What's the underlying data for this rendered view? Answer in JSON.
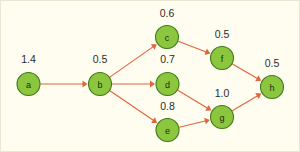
{
  "diagram": {
    "colors": {
      "background": "#fffdf0",
      "node_fill": "#8cc63f",
      "node_stroke": "#3f7a1e",
      "edge": "#e2643c",
      "text": "#2b2b2b"
    },
    "nodes": [
      {
        "id": "a",
        "label": "a",
        "weight": "1.4",
        "cx": 28.5,
        "cy": 84,
        "r": 11.5,
        "wx": 28.5,
        "wy": 63
      },
      {
        "id": "b",
        "label": "b",
        "weight": "0.5",
        "cx": 100,
        "cy": 84,
        "r": 11.5,
        "wx": 100,
        "wy": 63
      },
      {
        "id": "c",
        "label": "c",
        "weight": "0.6",
        "cx": 167,
        "cy": 37,
        "r": 11.5,
        "wx": 167,
        "wy": 17
      },
      {
        "id": "d",
        "label": "d",
        "weight": "0.7",
        "cx": 167.5,
        "cy": 84,
        "r": 11.5,
        "wx": 167.5,
        "wy": 63
      },
      {
        "id": "e",
        "label": "e",
        "weight": "0.8",
        "cx": 167.5,
        "cy": 130,
        "r": 11.5,
        "wx": 167.5,
        "wy": 110
      },
      {
        "id": "f",
        "label": "f",
        "weight": "0.5",
        "cx": 222,
        "cy": 58,
        "r": 11.5,
        "wx": 222,
        "wy": 38
      },
      {
        "id": "g",
        "label": "g",
        "weight": "1.0",
        "cx": 222,
        "cy": 117,
        "r": 11.5,
        "wx": 222,
        "wy": 97
      },
      {
        "id": "h",
        "label": "h",
        "weight": "0.5",
        "cx": 272,
        "cy": 87,
        "r": 11.5,
        "wx": 272,
        "wy": 67
      }
    ],
    "edges": [
      {
        "id": "a-b",
        "from": "a",
        "to": "b"
      },
      {
        "id": "b-c",
        "from": "b",
        "to": "c"
      },
      {
        "id": "b-d",
        "from": "b",
        "to": "d"
      },
      {
        "id": "b-e",
        "from": "b",
        "to": "e"
      },
      {
        "id": "c-f",
        "from": "c",
        "to": "f"
      },
      {
        "id": "d-g",
        "from": "d",
        "to": "g"
      },
      {
        "id": "e-g",
        "from": "e",
        "to": "g"
      },
      {
        "id": "f-h",
        "from": "f",
        "to": "h"
      },
      {
        "id": "g-h",
        "from": "g",
        "to": "h"
      }
    ]
  }
}
